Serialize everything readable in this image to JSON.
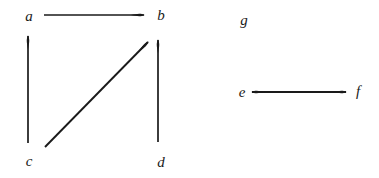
{
  "diagram": {
    "background_color": "#ffffff",
    "stroke_color": "#1a1a1a",
    "nodes": [
      {
        "id": "a",
        "label": "a",
        "x": 28,
        "y": 16
      },
      {
        "id": "b",
        "label": "b",
        "x": 160,
        "y": 15
      },
      {
        "id": "c",
        "label": "c",
        "x": 28,
        "y": 161
      },
      {
        "id": "d",
        "label": "d",
        "x": 160,
        "y": 162
      },
      {
        "id": "e",
        "label": "e",
        "x": 241,
        "y": 92
      },
      {
        "id": "f",
        "label": "f",
        "x": 357,
        "y": 91
      },
      {
        "id": "g",
        "label": "g",
        "x": 243,
        "y": 20
      }
    ],
    "edges": [
      {
        "id": "a-to-b",
        "from": "a",
        "to": "b",
        "kind": "directed",
        "x1": 44,
        "y1": 15,
        "x2": 144,
        "y2": 15
      },
      {
        "id": "c-to-a",
        "from": "c",
        "to": "a",
        "kind": "directed",
        "x1": 28,
        "y1": 143,
        "x2": 28,
        "y2": 36
      },
      {
        "id": "c-to-b",
        "from": "c",
        "to": "b",
        "kind": "directed",
        "x1": 45,
        "y1": 147,
        "x2": 148,
        "y2": 42
      },
      {
        "id": "d-to-b",
        "from": "d",
        "to": "b",
        "kind": "directed",
        "x1": 158,
        "y1": 142,
        "x2": 158,
        "y2": 40
      },
      {
        "id": "e-to-f",
        "from": "e",
        "to": "f",
        "kind": "bidirectional",
        "x1": 252,
        "y1": 92,
        "x2": 346,
        "y2": 92
      }
    ]
  }
}
